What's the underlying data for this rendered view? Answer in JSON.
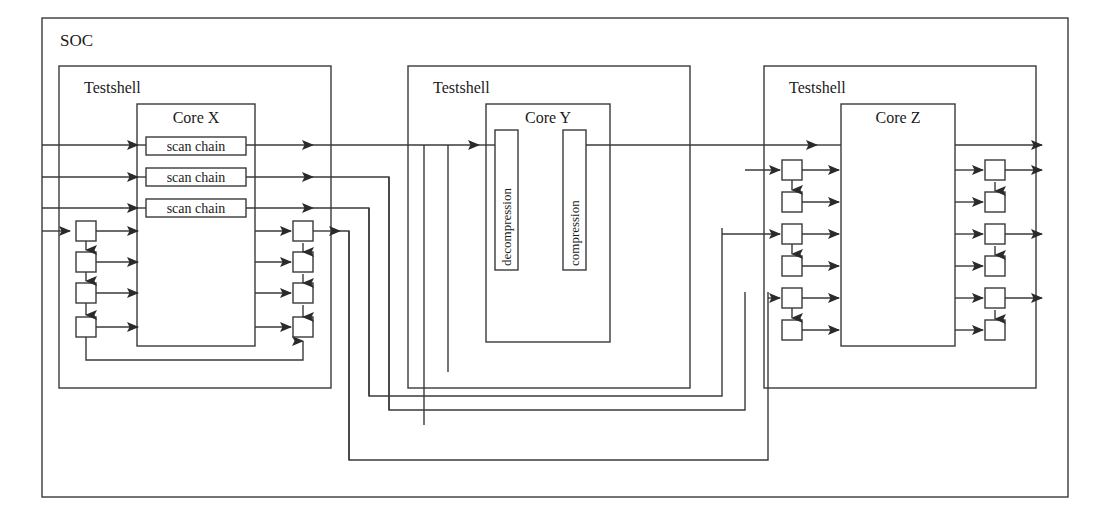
{
  "diagram": {
    "title_label": "SOC",
    "type": "block-diagram",
    "stroke_color": "#3a3a3a",
    "fill_color": "#ffffff",
    "text_color": "#1a1a1a",
    "soc": {
      "label": "SOC",
      "x": 42,
      "y": 18,
      "width": 1026,
      "height": 479
    },
    "testshells": [
      {
        "label": "Testshell",
        "x": 59,
        "y": 66,
        "width": 272,
        "height": 322,
        "label_x": 84,
        "label_y": 93
      },
      {
        "label": "Testshell",
        "x": 408,
        "y": 66,
        "width": 282,
        "height": 322,
        "label_x": 433,
        "label_y": 93
      },
      {
        "label": "Testshell",
        "x": 764,
        "y": 66,
        "width": 272,
        "height": 322,
        "label_x": 789,
        "label_y": 93
      }
    ],
    "cores": [
      {
        "label": "Core X",
        "x": 137,
        "y": 104,
        "width": 118,
        "height": 242,
        "label_x": 196,
        "label_y": 123
      },
      {
        "label": "Core Y",
        "x": 486,
        "y": 104,
        "width": 124,
        "height": 238,
        "label_x": 548,
        "label_y": 123
      },
      {
        "label": "Core Z",
        "x": 841,
        "y": 104,
        "width": 114,
        "height": 242,
        "label_x": 898,
        "label_y": 123
      }
    ],
    "scan_chains": [
      {
        "label": "scan chain",
        "x": 146,
        "y": 137,
        "width": 100,
        "height": 18
      },
      {
        "label": "scan chain",
        "x": 146,
        "y": 168,
        "width": 100,
        "height": 18
      },
      {
        "label": "scan chain",
        "x": 146,
        "y": 199,
        "width": 100,
        "height": 18
      }
    ],
    "core_y_blocks": [
      {
        "label": "decompression",
        "x": 495,
        "y": 130,
        "width": 22,
        "height": 140
      },
      {
        "label": "compression",
        "x": 563,
        "y": 130,
        "width": 22,
        "height": 140
      }
    ],
    "bypass_boxes": {
      "note": "small square multiplexer/bypass register cells",
      "size": 20,
      "core_x_left_x": 76,
      "core_x_right_x": 293,
      "core_x_ys": [
        221,
        252,
        283,
        317
      ],
      "core_z_left_x": 782,
      "core_z_right_x": 985,
      "core_z_left_ys": [
        160,
        192,
        224,
        256,
        288,
        320
      ],
      "core_z_right_ys": [
        160,
        192,
        224,
        256,
        288,
        320
      ]
    },
    "soc_inputs": [
      {
        "name": "scan-input-1",
        "y": 145
      },
      {
        "name": "scan-input-2",
        "y": 177
      },
      {
        "name": "scan-input-3",
        "y": 208
      },
      {
        "name": "bypass-input-1",
        "y": 231
      }
    ],
    "soc_outputs": [
      {
        "name": "scan-output-1",
        "y": 145
      },
      {
        "name": "scan-output-2",
        "y": 168
      },
      {
        "name": "scan-output-3",
        "y": 232
      },
      {
        "name": "scan-output-4",
        "y": 295
      }
    ]
  }
}
